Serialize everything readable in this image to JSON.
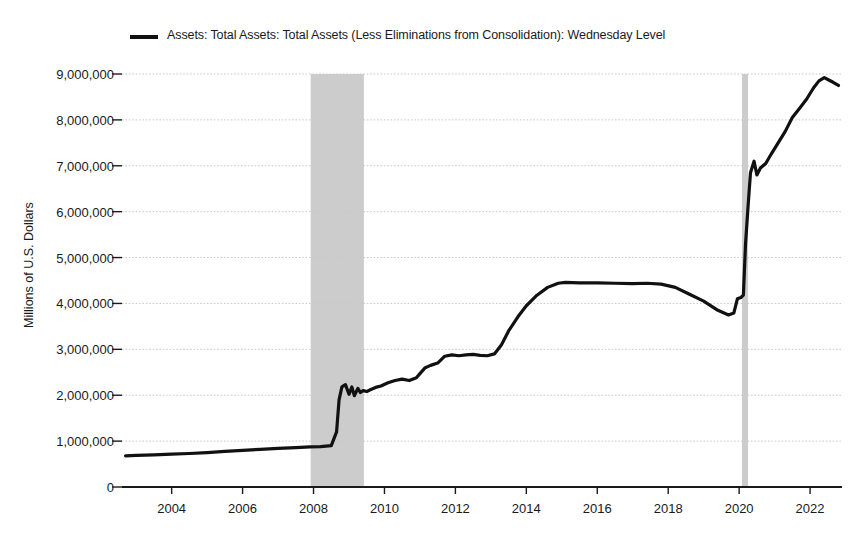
{
  "legend": {
    "label": "Assets: Total Assets: Total Assets (Less Eliminations from Consolidation): Wednesday Level",
    "marker_color": "#111111"
  },
  "axes": {
    "ylabel": "Millions of U.S. Dollars",
    "ytick_labels": [
      "9,000,000",
      "8,000,000",
      "7,000,000",
      "6,000,000",
      "5,000,000",
      "4,000,000",
      "3,000,000",
      "2,000,000",
      "1,000,000",
      "0"
    ],
    "xtick_labels": [
      "2004",
      "2006",
      "2008",
      "2010",
      "2012",
      "2014",
      "2016",
      "2018",
      "2020",
      "2022"
    ]
  },
  "colors": {
    "line": "#111111",
    "grid": "#c9c9c9",
    "axis": "#1a1a1a",
    "recession_band": "#cccccc",
    "background": "#ffffff"
  },
  "chart_data": {
    "type": "line",
    "title": "",
    "xlabel": "",
    "ylabel": "Millions of U.S. Dollars",
    "xlim": [
      2002.6,
      2022.9
    ],
    "ylim": [
      0,
      9000000
    ],
    "ytick_values": [
      0,
      1000000,
      2000000,
      3000000,
      4000000,
      5000000,
      6000000,
      7000000,
      8000000,
      9000000
    ],
    "xtick_values": [
      2004,
      2006,
      2008,
      2010,
      2012,
      2014,
      2016,
      2018,
      2020,
      2022
    ],
    "grid": true,
    "legend_position": "top-left",
    "series": [
      {
        "name": "Assets: Total Assets: Total Assets (Less Eliminations from Consolidation): Wednesday Level",
        "color": "#111111",
        "x": [
          2002.7,
          2003.0,
          2003.5,
          2004.0,
          2004.5,
          2005.0,
          2005.5,
          2006.0,
          2006.5,
          2007.0,
          2007.5,
          2007.9,
          2008.2,
          2008.5,
          2008.65,
          2008.72,
          2008.8,
          2008.9,
          2009.0,
          2009.08,
          2009.15,
          2009.25,
          2009.32,
          2009.4,
          2009.5,
          2009.6,
          2009.75,
          2009.9,
          2010.1,
          2010.3,
          2010.5,
          2010.7,
          2010.9,
          2011.0,
          2011.15,
          2011.3,
          2011.5,
          2011.7,
          2011.9,
          2012.1,
          2012.3,
          2012.5,
          2012.7,
          2012.9,
          2013.1,
          2013.3,
          2013.5,
          2013.8,
          2014.0,
          2014.3,
          2014.6,
          2014.9,
          2015.1,
          2015.5,
          2016.0,
          2016.5,
          2017.0,
          2017.4,
          2017.8,
          2018.2,
          2018.6,
          2019.0,
          2019.4,
          2019.7,
          2019.85,
          2019.95,
          2020.05,
          2020.12,
          2020.18,
          2020.25,
          2020.32,
          2020.42,
          2020.5,
          2020.6,
          2020.75,
          2020.9,
          2021.1,
          2021.3,
          2021.5,
          2021.7,
          2021.9,
          2022.1,
          2022.25,
          2022.4,
          2022.5,
          2022.65,
          2022.8
        ],
        "y": [
          680000,
          690000,
          700000,
          715000,
          730000,
          750000,
          775000,
          800000,
          820000,
          840000,
          860000,
          875000,
          880000,
          900000,
          1200000,
          1900000,
          2180000,
          2230000,
          2020000,
          2180000,
          1990000,
          2150000,
          2060000,
          2100000,
          2080000,
          2120000,
          2170000,
          2200000,
          2270000,
          2320000,
          2350000,
          2320000,
          2380000,
          2470000,
          2600000,
          2650000,
          2700000,
          2850000,
          2880000,
          2860000,
          2880000,
          2890000,
          2870000,
          2860000,
          2900000,
          3100000,
          3400000,
          3750000,
          3950000,
          4180000,
          4350000,
          4440000,
          4460000,
          4450000,
          4450000,
          4440000,
          4430000,
          4440000,
          4420000,
          4350000,
          4200000,
          4050000,
          3850000,
          3750000,
          3790000,
          4100000,
          4130000,
          4180000,
          5300000,
          6100000,
          6850000,
          7100000,
          6800000,
          6950000,
          7050000,
          7250000,
          7500000,
          7750000,
          8050000,
          8250000,
          8450000,
          8700000,
          8850000,
          8920000,
          8880000,
          8820000,
          8750000
        ]
      }
    ],
    "recession_bands": [
      {
        "start": 2007.92,
        "end": 2009.42
      },
      {
        "start": 2020.08,
        "end": 2020.25
      }
    ]
  }
}
